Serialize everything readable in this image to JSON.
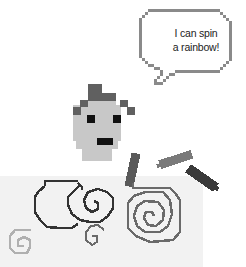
{
  "speech_bubble": {
    "line1": "I can spin",
    "line2": "a rainbow!"
  },
  "colors": {
    "bubble_outline": "#8a8a8a",
    "face": "#c8c8c8",
    "hair": "#606060",
    "eyes_mouth": "#111111",
    "canvas_bg": "#f2f2f2",
    "spiral_dark": "#333333",
    "spiral_mid": "#6a6a6a",
    "spiral_light": "#b0b0b0",
    "crayon_1": "#5a5a5a",
    "crayon_2": "#7a7a7a",
    "crayon_3": "#3a3a3a"
  },
  "icons": [
    "pixel-character",
    "speech-bubble",
    "crayon",
    "spiral"
  ]
}
